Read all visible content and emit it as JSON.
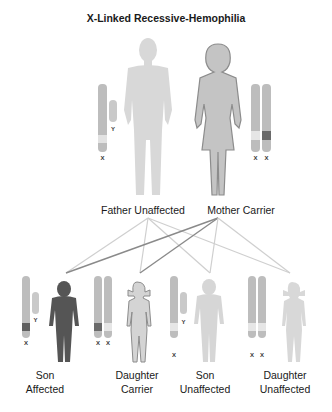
{
  "title": "X-Linked Recessive-Hemophilia",
  "parents": [
    {
      "id": "father",
      "label": "Father Unaffected",
      "chromosomes": [
        "X",
        "Y"
      ],
      "status": "unaffected"
    },
    {
      "id": "mother",
      "label": "Mother Carrier",
      "chromosomes": [
        "X",
        "X"
      ],
      "status": "carrier"
    }
  ],
  "children": [
    {
      "id": "son-affected",
      "line1": "Son",
      "line2": "Affected",
      "chromosomes": [
        "X",
        "Y"
      ],
      "status": "affected"
    },
    {
      "id": "daughter-carrier",
      "line1": "Daughter",
      "line2": "Carrier",
      "chromosomes": [
        "X",
        "X"
      ],
      "status": "carrier"
    },
    {
      "id": "son-unaffected",
      "line1": "Son",
      "line2": "Unaffected",
      "chromosomes": [
        "X",
        "Y"
      ],
      "status": "unaffected"
    },
    {
      "id": "daughter-unaffected",
      "line1": "Daughter",
      "line2": "Unaffected",
      "chromosomes": [
        "X",
        "X"
      ],
      "status": "unaffected"
    }
  ],
  "colors": {
    "affected": "#555555",
    "carrier_fill": "#c4c4c4",
    "unaffected": "#d6d6d6",
    "chromosome": "#b5b5b5",
    "mutant_band": "#6a6a6a",
    "normal_band": "#e6e6e6"
  }
}
